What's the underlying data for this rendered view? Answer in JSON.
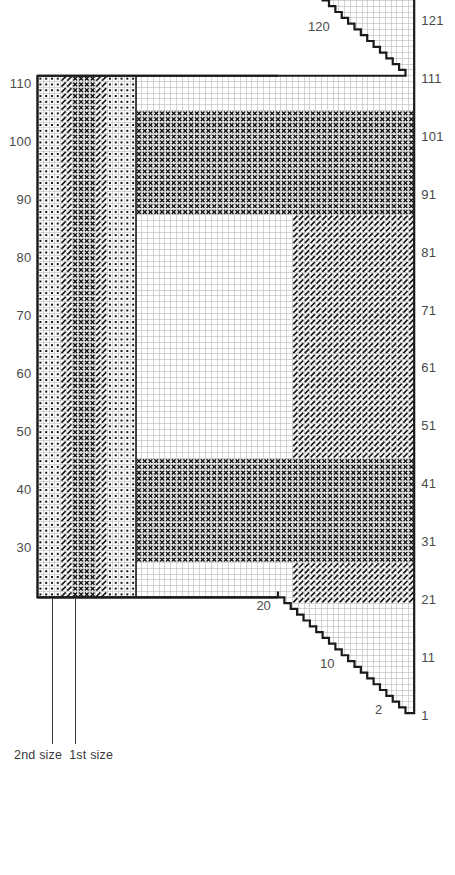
{
  "chart_title": "Chart 3",
  "chart_data": {
    "type": "heatmap",
    "title": "Chart 3",
    "grid": {
      "columns": 65,
      "rows": 131,
      "cell_px": 5.8,
      "gridline_color": "#b9b9b9",
      "outline_color": "#1a1a1a"
    },
    "xlabel": "",
    "ylabel": "",
    "axes": {
      "left": {
        "name": "even-row-numbers",
        "position": "left",
        "ticks": [
          110,
          100,
          90,
          80,
          70,
          60,
          50,
          40,
          30
        ]
      },
      "right": {
        "name": "odd-row-numbers",
        "position": "right",
        "ticks": [
          131,
          121,
          111,
          101,
          91,
          81,
          71,
          61,
          51,
          41,
          31,
          21,
          11,
          1
        ]
      }
    },
    "inner_annotations": [
      {
        "label": "130",
        "region": "top-stepped-edge"
      },
      {
        "label": "120",
        "region": "top-stepped-edge"
      },
      {
        "label": "20",
        "region": "bottom-stepped-edge"
      },
      {
        "label": "10",
        "region": "bottom-stepped-edge"
      },
      {
        "label": "2",
        "region": "bottom-stepped-edge"
      }
    ],
    "size_markers": [
      {
        "label": "2nd size",
        "column": 2
      },
      {
        "label": "1st size",
        "column": 6
      }
    ],
    "symbols": [
      {
        "key": "dot",
        "name": "purl-dot",
        "glyph": "•",
        "color": "#1a1a1a"
      },
      {
        "key": "slash",
        "name": "diagonal-slash",
        "glyph": "/",
        "color": "#1a1a1a"
      },
      {
        "key": "cross",
        "name": "cross-x",
        "glyph": "X",
        "color": "#1a1a1a"
      },
      {
        "key": "blank",
        "name": "empty-cell",
        "glyph": "",
        "color": "#ffffff"
      }
    ],
    "column_bands_left_panel": [
      {
        "symbol": "dot",
        "from_col": 0,
        "to_col": 3
      },
      {
        "symbol": "slash",
        "from_col": 4,
        "to_col": 5
      },
      {
        "symbol": "cross",
        "from_col": 6,
        "to_col": 9
      },
      {
        "symbol": "slash",
        "from_col": 10,
        "to_col": 11
      },
      {
        "symbol": "dot",
        "from_col": 12,
        "to_col": 16
      }
    ],
    "regions": [
      {
        "name": "left-vertical-band",
        "symbol": "mixed",
        "cols": [
          0,
          16
        ],
        "rows": [
          20,
          131
        ]
      },
      {
        "name": "upper-cross-block",
        "symbol": "cross",
        "cols": [
          17,
          64
        ],
        "rows": [
          88,
          105
        ]
      },
      {
        "name": "lower-cross-block",
        "symbol": "cross",
        "cols": [
          17,
          64
        ],
        "rows": [
          28,
          45
        ]
      },
      {
        "name": "right-slash-field",
        "symbol": "slash",
        "cols": [
          44,
          64
        ],
        "rows": [
          45,
          88
        ]
      },
      {
        "name": "center-blank-panel",
        "symbol": "blank",
        "cols": [
          17,
          43
        ],
        "rows": [
          45,
          88
        ]
      },
      {
        "name": "top-shaped-wedge",
        "symbol": "blank",
        "cols": [
          42,
          64
        ],
        "rows": [
          111,
          131
        ]
      },
      {
        "name": "bottom-shaped-wedge",
        "symbol": "blank",
        "cols": [
          42,
          64
        ],
        "rows": [
          1,
          20
        ]
      }
    ]
  }
}
